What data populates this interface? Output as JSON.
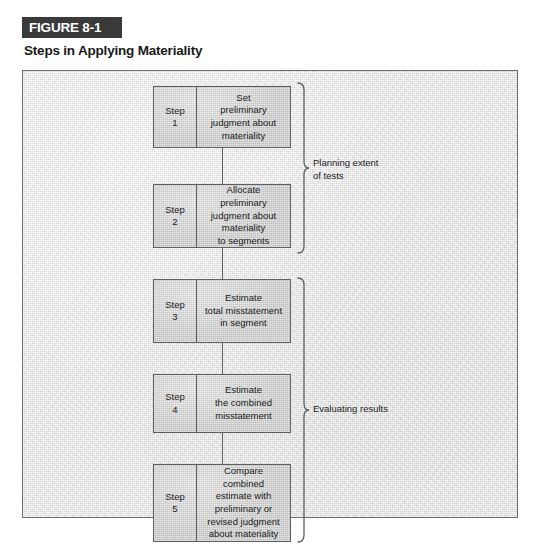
{
  "figure": {
    "label": "FIGURE 8-1",
    "title": "Steps in Applying Materiality",
    "badge_color": "#3a3a3a",
    "panel_bg": "#e3e3e3",
    "box_bg": "#c9c9c9",
    "line_color": "#5f5f5f"
  },
  "diagram": {
    "type": "flowchart",
    "steps": [
      {
        "step_label": "Step",
        "step_number": "1",
        "lines": [
          "Set",
          "preliminary",
          "judgment about",
          "materiality"
        ]
      },
      {
        "step_label": "Step",
        "step_number": "2",
        "lines": [
          "Allocate",
          "preliminary",
          "judgment about",
          "materiality",
          "to segments"
        ]
      },
      {
        "step_label": "Step",
        "step_number": "3",
        "lines": [
          "Estimate",
          "total misstatement",
          "in segment"
        ]
      },
      {
        "step_label": "Step",
        "step_number": "4",
        "lines": [
          "Estimate",
          "the combined",
          "misstatement"
        ]
      },
      {
        "step_label": "Step",
        "step_number": "5",
        "lines": [
          "Compare",
          "combined",
          "estimate with",
          "preliminary or",
          "revised judgment",
          "about materiality"
        ]
      }
    ],
    "brackets": [
      {
        "id": "planning",
        "covers_steps": [
          "1",
          "2"
        ],
        "lines": [
          "Planning extent",
          "of tests"
        ]
      },
      {
        "id": "evaluating",
        "covers_steps": [
          "3",
          "4",
          "5"
        ],
        "lines": [
          "Evaluating results"
        ]
      }
    ]
  }
}
